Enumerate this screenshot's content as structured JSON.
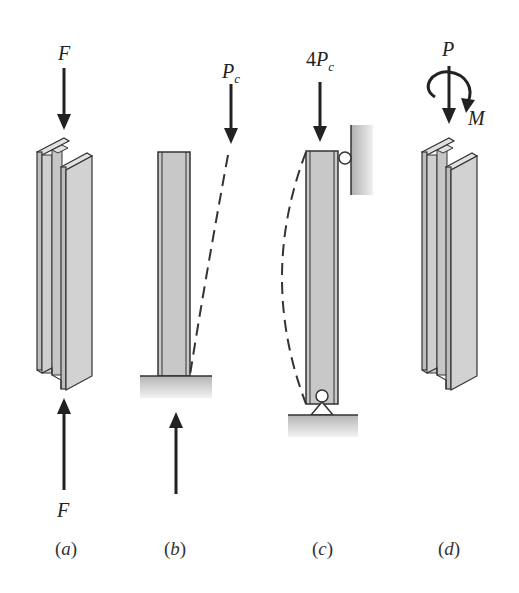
{
  "figure": {
    "panels": [
      {
        "id": "a",
        "caption_letter": "a",
        "column": "wide-flange I-beam column",
        "top_load_label": "F",
        "bottom_load_label": "F"
      },
      {
        "id": "b",
        "caption_letter": "b",
        "column": "column fixed at base, free at top",
        "top_load_label_main": "P",
        "top_load_label_sub": "c",
        "buckled_shape": "dashed curve"
      },
      {
        "id": "c",
        "caption_letter": "c",
        "column": "pinned-pinned column with roller against wall",
        "top_load_label_prefix": "4",
        "top_load_label_main": "P",
        "top_load_label_sub": "c",
        "buckled_shape": "dashed half-sine curve"
      },
      {
        "id": "d",
        "caption_letter": "d",
        "column": "wide-flange I-beam column",
        "axial_load_label": "P",
        "moment_label": "M"
      }
    ],
    "colors": {
      "steel_fill": "#c9c9c9",
      "steel_fill_light": "#d8d8d8",
      "outline": "#333333",
      "ground": "#bdbdbd",
      "arrow": "#222222"
    }
  }
}
